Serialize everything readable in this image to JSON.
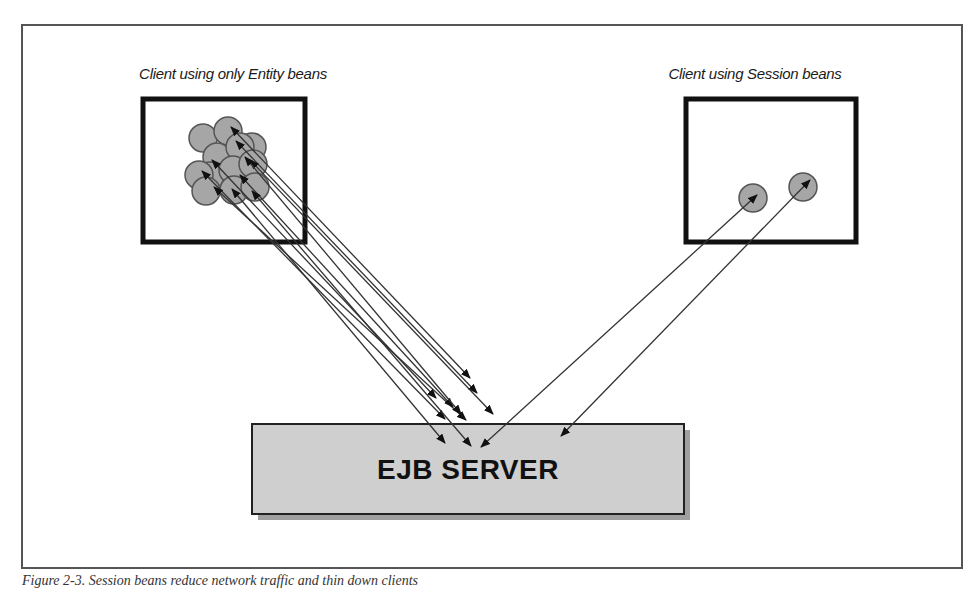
{
  "figure": {
    "caption": "Figure 2-3. Session beans reduce network traffic and thin down clients",
    "frame": {
      "x": 22,
      "y": 25,
      "w": 940,
      "h": 543,
      "color": "#555555"
    }
  },
  "clients": [
    {
      "id": "entity-client",
      "title": "Client using only Entity beans",
      "title_pos": {
        "x": 233,
        "y": 79
      },
      "box": {
        "x": 143,
        "y": 99,
        "w": 162,
        "h": 143
      }
    },
    {
      "id": "session-client",
      "title": "Client using Session beans",
      "title_pos": {
        "x": 755,
        "y": 79
      },
      "box": {
        "x": 686,
        "y": 99,
        "w": 170,
        "h": 143
      }
    }
  ],
  "server": {
    "label": "EJB SERVER",
    "box": {
      "x": 252,
      "y": 424,
      "w": 432,
      "h": 90
    },
    "fill": "#cfcfcf",
    "shadow": "#777777"
  },
  "colors": {
    "bean_fill": "#a6a6a6",
    "bean_stroke": "#555555",
    "line": "#333333",
    "box_border": "#111111"
  },
  "entity_beans": [
    {
      "cx": 203,
      "cy": 138
    },
    {
      "cx": 228,
      "cy": 131
    },
    {
      "cx": 252,
      "cy": 147
    },
    {
      "cx": 217,
      "cy": 157
    },
    {
      "cx": 240,
      "cy": 147
    },
    {
      "cx": 210,
      "cy": 176
    },
    {
      "cx": 233,
      "cy": 170
    },
    {
      "cx": 253,
      "cy": 164
    },
    {
      "cx": 199,
      "cy": 175
    },
    {
      "cx": 206,
      "cy": 191
    },
    {
      "cx": 234,
      "cy": 190
    },
    {
      "cx": 255,
      "cy": 187
    }
  ],
  "entity_arrows": [
    {
      "x1": 231,
      "y1": 127,
      "x2": 470,
      "y2": 378
    },
    {
      "x1": 236,
      "y1": 141,
      "x2": 477,
      "y2": 393
    },
    {
      "x1": 250,
      "y1": 160,
      "x2": 493,
      "y2": 414
    },
    {
      "x1": 202,
      "y1": 171,
      "x2": 445,
      "y2": 419
    },
    {
      "x1": 214,
      "y1": 187,
      "x2": 466,
      "y2": 420
    },
    {
      "x1": 240,
      "y1": 175,
      "x2": 453,
      "y2": 407
    },
    {
      "x1": 212,
      "y1": 160,
      "x2": 436,
      "y2": 398
    },
    {
      "x1": 232,
      "y1": 189,
      "x2": 445,
      "y2": 443
    },
    {
      "x1": 252,
      "y1": 191,
      "x2": 471,
      "y2": 446
    },
    {
      "x1": 245,
      "y1": 157,
      "x2": 461,
      "y2": 414
    }
  ],
  "session_beans": [
    {
      "cx": 753,
      "cy": 198
    },
    {
      "cx": 803,
      "cy": 187
    }
  ],
  "session_arrows": [
    {
      "x1": 481,
      "y1": 447,
      "x2": 757,
      "y2": 195
    },
    {
      "x1": 561,
      "y1": 436,
      "x2": 810,
      "y2": 180
    }
  ]
}
